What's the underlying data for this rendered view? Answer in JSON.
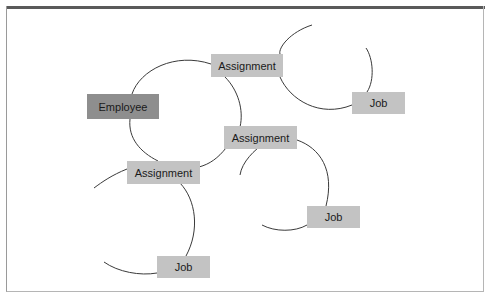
{
  "diagram": {
    "type": "entity-relationship network",
    "nodes": [
      {
        "id": "employee",
        "label": "Employee",
        "x": 87,
        "y": 94,
        "w": 72,
        "h": 25,
        "fill": "#8e8e8e"
      },
      {
        "id": "assignment1",
        "label": "Assignment",
        "x": 211,
        "y": 54,
        "w": 72,
        "h": 23,
        "fill": "#c3c3c3"
      },
      {
        "id": "assignment2",
        "label": "Assignment",
        "x": 224,
        "y": 126,
        "w": 73,
        "h": 23,
        "fill": "#c3c3c3"
      },
      {
        "id": "assignment3",
        "label": "Assignment",
        "x": 127,
        "y": 161,
        "w": 73,
        "h": 23,
        "fill": "#c3c3c3"
      },
      {
        "id": "job1",
        "label": "Job",
        "x": 352,
        "y": 92,
        "w": 53,
        "h": 22,
        "fill": "#c3c3c3"
      },
      {
        "id": "job2",
        "label": "Job",
        "x": 307,
        "y": 206,
        "w": 53,
        "h": 22,
        "fill": "#c3c3c3"
      },
      {
        "id": "job3",
        "label": "Job",
        "x": 157,
        "y": 256,
        "w": 53,
        "h": 22,
        "fill": "#c3c3c3"
      }
    ],
    "edges": [
      {
        "from": "employee",
        "to": "assignment1"
      },
      {
        "from": "employee",
        "to": "assignment2"
      },
      {
        "from": "employee",
        "to": "assignment3"
      },
      {
        "from": "assignment1",
        "to": "job1"
      },
      {
        "from": "assignment2",
        "to": "job2"
      },
      {
        "from": "assignment3",
        "to": "job3"
      }
    ]
  }
}
